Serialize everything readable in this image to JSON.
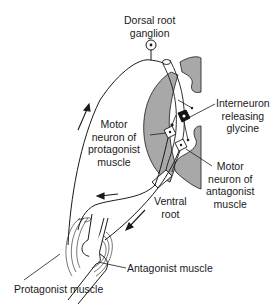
{
  "diagram": {
    "type": "reciprocal inhibition reflex arc",
    "colors": {
      "line": "#1a1a1a",
      "gray_matter": "#a8a8a8",
      "background": "#ffffff",
      "interneuron_fill": "#111111"
    },
    "labels": {
      "dorsal_root_ganglion": [
        "Dorsal root",
        "ganglion"
      ],
      "interneuron": [
        "Interneuron",
        "releasing",
        "glycine"
      ],
      "motor_protagonist": [
        "Motor",
        "neuron of",
        "protagonist",
        "muscle"
      ],
      "motor_antagonist": [
        "Motor",
        "neuron of",
        "antagonist",
        "muscle"
      ],
      "ventral_root": [
        "Ventral",
        "root"
      ],
      "antagonist_muscle": "Antagonist muscle",
      "protagonist_muscle": "Protagonist muscle"
    },
    "arrows": [
      {
        "name": "afferent-upward-arrow",
        "direction": "up"
      },
      {
        "name": "efferent-to-protagonist-arrow",
        "direction": "left"
      },
      {
        "name": "efferent-to-antagonist-arrow",
        "direction": "down-left"
      }
    ]
  }
}
